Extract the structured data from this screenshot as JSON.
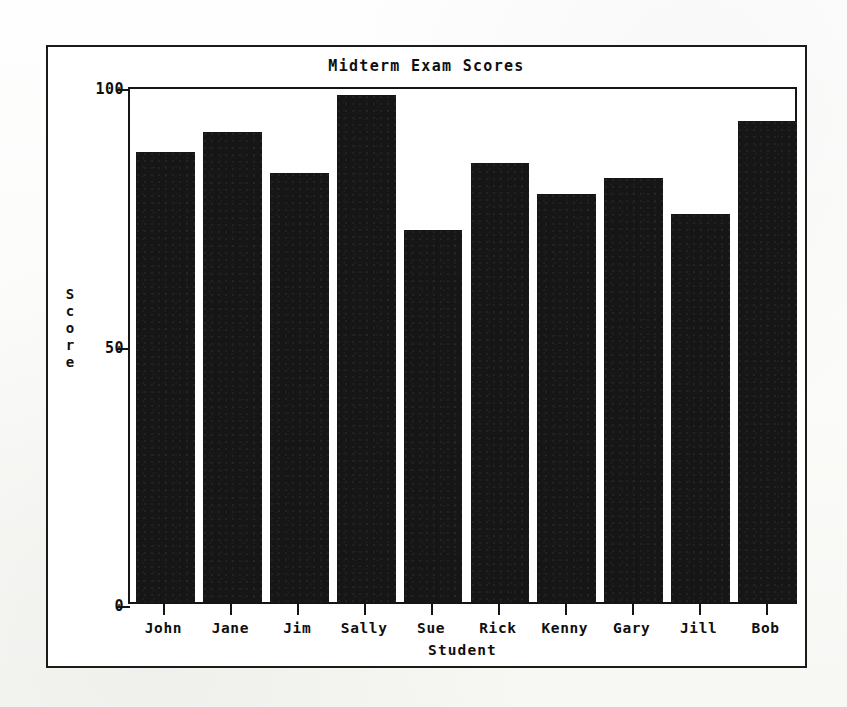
{
  "chart_data": {
    "type": "bar",
    "title": "Midterm Exam Scores",
    "xlabel": "Student",
    "ylabel": "Score",
    "categories": [
      "John",
      "Jane",
      "Jim",
      "Sally",
      "Sue",
      "Rick",
      "Kenny",
      "Gary",
      "Jill",
      "Bob"
    ],
    "values": [
      87,
      91,
      83,
      98,
      72,
      85,
      79,
      82,
      75,
      93
    ],
    "ylim": [
      0,
      100
    ],
    "ytick_labels": [
      "0",
      "50",
      "100"
    ],
    "ytick_values": [
      0,
      50,
      100
    ],
    "grid": false,
    "legend": false,
    "bar_color": "#161616",
    "axis_color": "#151515",
    "background_color": "#ffffff"
  },
  "figure": {
    "frame_border_color": "#1b1b1b",
    "ylabel_letters": [
      "S",
      "c",
      "o",
      "r",
      "e"
    ]
  }
}
